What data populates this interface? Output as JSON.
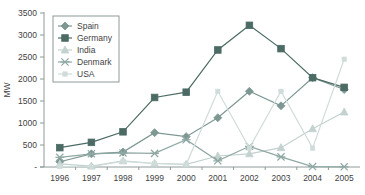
{
  "chart_data": {
    "type": "line",
    "title": "",
    "xlabel": "",
    "ylabel": "MW",
    "categories": [
      "1996",
      "1997",
      "1998",
      "1999",
      "2000",
      "2001",
      "2002",
      "2003",
      "2004",
      "2005"
    ],
    "ylim": [
      0,
      3500
    ],
    "ytick_labels": [
      "3500",
      "3000",
      "2500",
      "2000",
      "1500",
      "1000",
      "500",
      "-"
    ],
    "ytick_values": [
      3500,
      3000,
      2500,
      2000,
      1500,
      1000,
      500,
      0
    ],
    "grid": false,
    "legend_position": "top-left",
    "series": [
      {
        "name": "Spain",
        "marker": "diamond",
        "color": "#7d9792",
        "values": [
          120,
          300,
          340,
          780,
          690,
          1120,
          1720,
          1390,
          2030,
          1760
        ]
      },
      {
        "name": "Germany",
        "marker": "square",
        "color": "#4c6b64",
        "values": [
          440,
          560,
          800,
          1580,
          1700,
          2660,
          3220,
          2690,
          2030,
          1810
        ]
      },
      {
        "name": "India",
        "marker": "triangle",
        "color": "#c3d2cf",
        "values": [
          70,
          20,
          140,
          80,
          60,
          250,
          300,
          440,
          870,
          1250
        ]
      },
      {
        "name": "Denmark",
        "marker": "x",
        "color": "#8fa8a4",
        "values": [
          220,
          300,
          320,
          310,
          620,
          140,
          470,
          230,
          10,
          4
        ]
      },
      {
        "name": "USA",
        "marker": "dot",
        "color": "#cfdcda",
        "values": [
          10,
          10,
          130,
          80,
          60,
          1720,
          430,
          1720,
          430,
          2450
        ]
      }
    ]
  }
}
